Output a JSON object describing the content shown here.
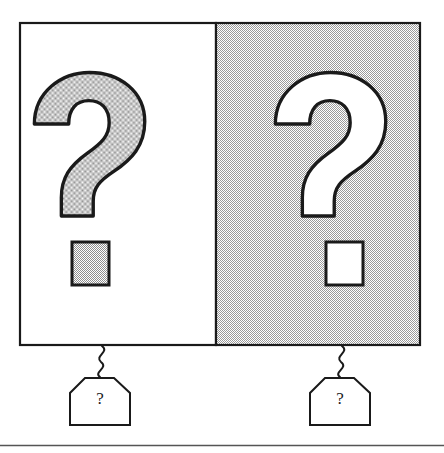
{
  "figure": {
    "colors": {
      "ink": "#1a1a1a",
      "panel_light": "#ffffff",
      "panel_shaded": "#c9c9c9",
      "glyph_shaded_fill": "#bdbdbd",
      "glyph_light_fill": "#ffffff",
      "rule": "#555555"
    }
  },
  "panels": [
    {
      "id": "left-panel",
      "name": "left-panel",
      "background": "light",
      "glyph": {
        "name": "question-mark-glyph",
        "character": "?",
        "fill": "shaded"
      },
      "dot": {
        "name": "question-mark-dot",
        "fill": "shaded"
      },
      "tag": {
        "name": "left-panel-tag",
        "label": "?"
      }
    },
    {
      "id": "right-panel",
      "name": "right-panel",
      "background": "shaded",
      "glyph": {
        "name": "question-mark-glyph",
        "character": "?",
        "fill": "light"
      },
      "dot": {
        "name": "question-mark-dot",
        "fill": "light"
      },
      "tag": {
        "name": "right-panel-tag",
        "label": "?"
      }
    }
  ],
  "footer": {
    "rule_present": true
  }
}
